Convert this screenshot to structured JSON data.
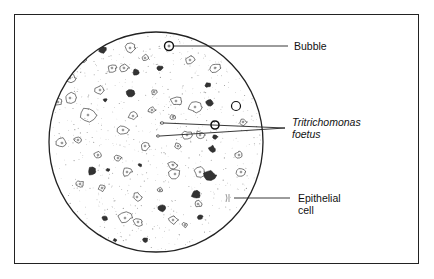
{
  "figure": {
    "type": "microscope-field-illustration",
    "labels": {
      "bubble": "Bubble",
      "organism_line1": "Tritrichomonas",
      "organism_line2": "foetus",
      "epithelial_line1": "Epithelial",
      "epithelial_line2": "cell"
    },
    "colors": {
      "ink": "#222222",
      "stipple": "#9a9a9a",
      "background": "#ffffff"
    }
  }
}
